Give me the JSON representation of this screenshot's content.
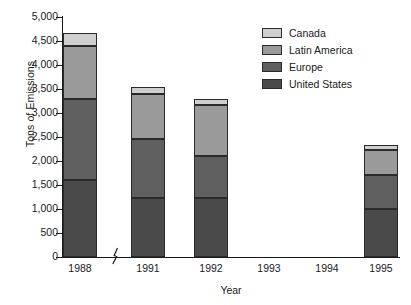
{
  "chart_data": {
    "type": "bar",
    "stacked": true,
    "title": "",
    "xlabel": "Year",
    "ylabel": "Tons of Emissions",
    "categories": [
      "1988",
      "1991",
      "1992",
      "1993",
      "1994",
      "1995"
    ],
    "ylim": [
      0,
      5000
    ],
    "ytick_values": [
      0,
      500,
      1000,
      1500,
      2000,
      2500,
      3000,
      3500,
      4000,
      4500,
      5000
    ],
    "ytick_labels": [
      "0",
      "500",
      "1,000",
      "1,500",
      "2,000",
      "2,500",
      "3,000",
      "3,500",
      "4,000",
      "4,500",
      "5,000"
    ],
    "grid": false,
    "legend_position": "top-right",
    "axis_break_after_category": "1988",
    "series": [
      {
        "name": "United States",
        "color": "#4a4a4a",
        "values": [
          1600,
          1230,
          1230,
          null,
          null,
          1000
        ]
      },
      {
        "name": "Europe",
        "color": "#5f5f5f",
        "values": [
          1700,
          1220,
          870,
          null,
          null,
          710
        ]
      },
      {
        "name": "Latin America",
        "color": "#9a9a9a",
        "values": [
          1100,
          950,
          1070,
          null,
          null,
          520
        ]
      },
      {
        "name": "Canada",
        "color": "#cfcfcf",
        "values": [
          270,
          150,
          130,
          null,
          null,
          100
        ]
      }
    ],
    "totals": [
      4670,
      3550,
      3300,
      null,
      null,
      2330
    ]
  },
  "legend": {
    "entries": [
      {
        "label": "Canada",
        "color": "#cfcfcf"
      },
      {
        "label": "Latin America",
        "color": "#9a9a9a"
      },
      {
        "label": "Europe",
        "color": "#5f5f5f"
      },
      {
        "label": "United States",
        "color": "#4a4a4a"
      }
    ]
  },
  "axes": {
    "y_title": "Tons of Emissions",
    "x_title": "Year"
  }
}
